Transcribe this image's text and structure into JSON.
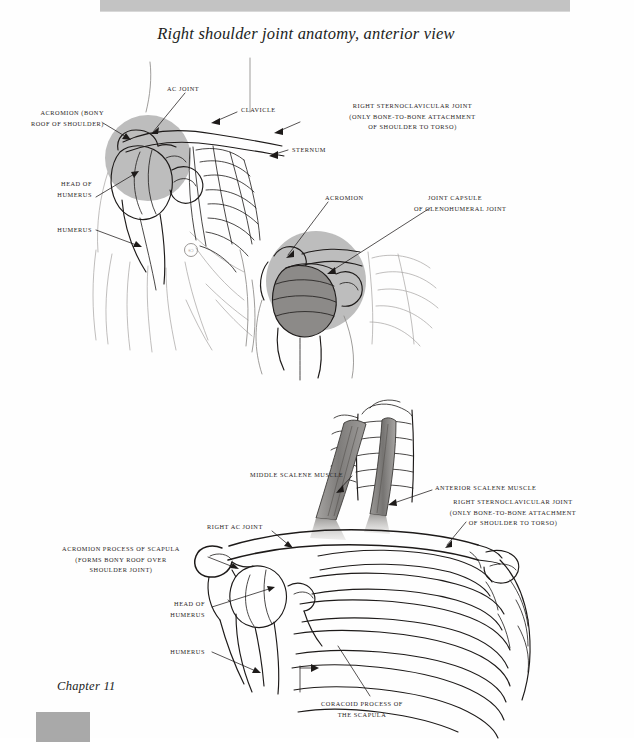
{
  "document": {
    "title": "Right shoulder joint anatomy, anterior view",
    "chapter": "Chapter 11",
    "copyright_mark": "©"
  },
  "colors": {
    "header_band": "#c3c3c3",
    "highlight_circle": "#bdbdbd",
    "capsule_gray": "#8c8a88",
    "muscle_gray": "#8a8886",
    "ink": "#1d1a19",
    "chapter_box": "#a9a9a9"
  },
  "figure_top": {
    "name": "right-shoulder-anterior-overview",
    "labels": [
      {
        "id": "ac-joint",
        "lines": [
          "AC JOINT"
        ],
        "align": "left",
        "x": 167,
        "y": 87
      },
      {
        "id": "acromion-bony-roof",
        "lines": [
          "ACROMION (BONY",
          "ROOF OF SHOULDER)"
        ],
        "align": "right",
        "x": 24,
        "y": 111
      },
      {
        "id": "clavicle",
        "lines": [
          "CLAVICLE"
        ],
        "align": "left",
        "x": 241,
        "y": 108
      },
      {
        "id": "right-sternoclavicular-joint",
        "lines": [
          "RIGHT STERNOCLAVICULAR JOINT",
          "(ONLY BONE-TO-BONE ATTACHMENT",
          "OF SHOULDER TO TORSO)"
        ],
        "align": "center",
        "x": 310,
        "y": 104
      },
      {
        "id": "sternum",
        "lines": [
          "STERNUM"
        ],
        "align": "left",
        "x": 292,
        "y": 148
      },
      {
        "id": "head-of-humerus",
        "lines": [
          "HEAD OF",
          "HUMERUS"
        ],
        "align": "right",
        "x": 55,
        "y": 182
      },
      {
        "id": "humerus",
        "lines": [
          "HUMERUS"
        ],
        "align": "right",
        "x": 55,
        "y": 228
      }
    ]
  },
  "figure_inset": {
    "name": "glenohumeral-joint-capsule-detail",
    "labels": [
      {
        "id": "acromion",
        "lines": [
          "ACROMION"
        ],
        "align": "left",
        "x": 325,
        "y": 196
      },
      {
        "id": "joint-capsule-glenohumeral",
        "lines": [
          "JOINT CAPSULE",
          "OF GLENOHUMERAL JOINT"
        ],
        "align": "left",
        "x": 428,
        "y": 196
      }
    ]
  },
  "figure_bottom": {
    "name": "shoulder-girdle-ribcage-anterior",
    "labels": [
      {
        "id": "middle-scalene-muscle",
        "lines": [
          "MIDDLE SCALENE MUSCLE"
        ],
        "align": "left",
        "x": 250,
        "y": 472
      },
      {
        "id": "anterior-scalene-muscle",
        "lines": [
          "ANTERIOR SCALENE MUSCLE"
        ],
        "align": "left",
        "x": 435,
        "y": 485
      },
      {
        "id": "right-sternoclavicular-joint-bottom",
        "lines": [
          "RIGHT STERNOCLAVICULAR JOINT",
          "(ONLY BONE-TO-BONE ATTACHMENT",
          "OF SHOULDER TO TORSO)"
        ],
        "align": "center",
        "x": 513,
        "y": 500
      },
      {
        "id": "right-ac-joint",
        "lines": [
          "RIGHT AC JOINT"
        ],
        "align": "left",
        "x": 207,
        "y": 524
      },
      {
        "id": "acromion-process-of-scapula",
        "lines": [
          "ACROMION PROCESS OF SCAPULA",
          "(FORMS BONY ROOF OVER",
          "SHOULDER JOINT)"
        ],
        "align": "center",
        "x": 143,
        "y": 546
      },
      {
        "id": "head-of-humerus-bottom",
        "lines": [
          "HEAD OF",
          "HUMERUS"
        ],
        "align": "right",
        "x": 205,
        "y": 601
      },
      {
        "id": "humerus-bottom",
        "lines": [
          "HUMERUS"
        ],
        "align": "right",
        "x": 205,
        "y": 649
      },
      {
        "id": "coracoid-process-of-the-scapula",
        "lines": [
          "CORACOID PROCESS OF",
          "THE SCAPULA"
        ],
        "align": "center",
        "x": 362,
        "y": 701
      }
    ]
  }
}
